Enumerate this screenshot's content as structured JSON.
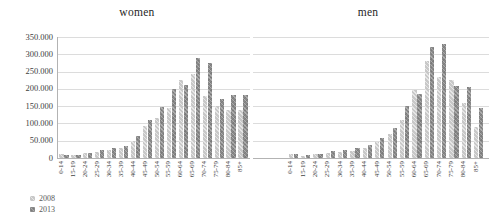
{
  "colors": {
    "bar_2008": "#c8c8c8",
    "bar_2013": "#898989",
    "gridline": "#dcdcdc",
    "axis": "#b3b3b3"
  },
  "legend": {
    "items": [
      {
        "label": "2008",
        "color": "#c8c8c8"
      },
      {
        "label": "2013",
        "color": "#898989"
      }
    ]
  },
  "y_axis": {
    "tick_labels_top_to_bottom": [
      "350.000",
      "300.000",
      "250.000",
      "200.000",
      "150.000",
      "100.000",
      "50.000",
      "0"
    ]
  },
  "chart_data": [
    {
      "type": "bar",
      "title": "women",
      "categories": [
        "0-14",
        "15-19",
        "20-24",
        "25-29",
        "30-34",
        "35-39",
        "40-44",
        "45-49",
        "50-54",
        "55-59",
        "60-64",
        "65-69",
        "70-74",
        "75-79",
        "80-84",
        "85+"
      ],
      "series": [
        {
          "name": "2008",
          "values": [
            12000,
            8000,
            14000,
            18000,
            23000,
            29000,
            50000,
            92000,
            115000,
            145000,
            225000,
            242000,
            180000,
            150000,
            140000,
            138000
          ]
        },
        {
          "name": "2013",
          "values": [
            10000,
            9000,
            16000,
            23000,
            30000,
            35000,
            63000,
            110000,
            149000,
            200000,
            212000,
            290000,
            275000,
            172000,
            183000,
            182000
          ]
        }
      ],
      "ylim": [
        0,
        350000
      ],
      "ytick_step": 50000,
      "grid": "horizontal",
      "y_axis_labels_visible": true,
      "legend_position": "bottom-left"
    },
    {
      "type": "bar",
      "title": "men",
      "categories": [
        "0-14",
        "15-19",
        "20-24",
        "25-29",
        "30-34",
        "35-39",
        "40-44",
        "45-49",
        "50-54",
        "55-59",
        "60-64",
        "65-69",
        "70-74",
        "75-79",
        "80-84",
        "85+"
      ],
      "series": [
        {
          "name": "2008",
          "values": [
            13000,
            7000,
            12000,
            15000,
            17000,
            21000,
            29000,
            46000,
            70000,
            110000,
            197000,
            280000,
            235000,
            225000,
            158000,
            90000
          ]
        },
        {
          "name": "2013",
          "values": [
            13000,
            10000,
            13000,
            19000,
            24000,
            29000,
            39000,
            58000,
            87000,
            150000,
            185000,
            322000,
            330000,
            209000,
            206000,
            145000
          ]
        }
      ],
      "ylim": [
        0,
        350000
      ],
      "ytick_step": 50000,
      "grid": "horizontal",
      "y_axis_labels_visible": false,
      "legend_position": "none"
    }
  ]
}
